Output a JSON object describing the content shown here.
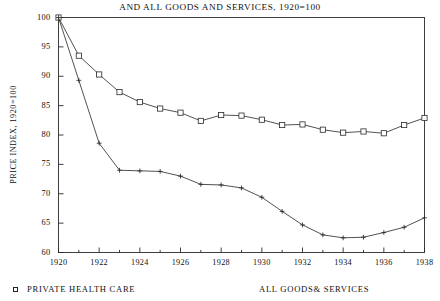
{
  "chart_data": {
    "type": "line",
    "title": "AND ALL GOODS AND SERVICES, 1920=100",
    "xlabel": "",
    "ylabel": "PRICE INDEX, 1920=100",
    "xlim": [
      1920,
      1938
    ],
    "ylim": [
      60,
      100
    ],
    "grid": false,
    "legend_position": "below",
    "x": [
      1920,
      1921,
      1922,
      1923,
      1924,
      1925,
      1926,
      1927,
      1928,
      1929,
      1930,
      1931,
      1932,
      1933,
      1934,
      1935,
      1936,
      1937,
      1938
    ],
    "xticks": [
      1920,
      1922,
      1924,
      1926,
      1928,
      1930,
      1932,
      1934,
      1936,
      1938
    ],
    "xtick_labels": [
      "1920",
      "1922",
      "1924",
      "1926",
      "1928",
      "1930",
      "1932",
      "1934",
      "1936",
      "1938"
    ],
    "yticks": [
      60,
      65,
      70,
      75,
      80,
      85,
      90,
      95,
      100
    ],
    "ytick_labels": [
      "60",
      "65",
      "70",
      "75",
      "80",
      "85",
      "90",
      "95",
      "100"
    ],
    "series": [
      {
        "name": "PRIVATE HEALTH CARE",
        "marker": "square",
        "values": [
          100,
          93.5,
          90.3,
          87.3,
          85.6,
          84.5,
          83.8,
          82.4,
          83.4,
          83.3,
          82.6,
          81.7,
          81.8,
          80.9,
          80.4,
          80.6,
          80.3,
          81.7,
          82.9
        ]
      },
      {
        "name": "ALL GOODS& SERVICES",
        "marker": "plus",
        "values": [
          100,
          89.3,
          78.6,
          74.0,
          73.9,
          73.8,
          73.0,
          71.6,
          71.5,
          71.0,
          69.4,
          67.0,
          64.7,
          63.0,
          62.5,
          62.6,
          63.4,
          64.3,
          65.9
        ]
      }
    ]
  },
  "legend": {
    "items": [
      {
        "label": "PRIVATE HEALTH CARE",
        "marker": "square"
      },
      {
        "label": "ALL GOODS& SERVICES",
        "marker": "none"
      }
    ]
  }
}
